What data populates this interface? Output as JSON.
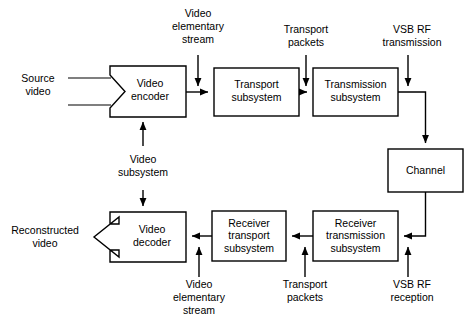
{
  "diagram": {
    "blocks": [
      {
        "id": "video-encoder",
        "label_line1": "Video",
        "label_line2": "encoder",
        "label_line3": ""
      },
      {
        "id": "transport-subsystem",
        "label_line1": "Transport",
        "label_line2": "subsystem",
        "label_line3": ""
      },
      {
        "id": "transmission-subsystem",
        "label_line1": "Transmission",
        "label_line2": "subsystem",
        "label_line3": ""
      },
      {
        "id": "channel",
        "label_line1": "Channel",
        "label_line2": "",
        "label_line3": ""
      },
      {
        "id": "receiver-transmission-subsystem",
        "label_line1": "Receiver",
        "label_line2": "transmission",
        "label_line3": "subsystem"
      },
      {
        "id": "receiver-transport-subsystem",
        "label_line1": "Receiver",
        "label_line2": "transport",
        "label_line3": "subsystem"
      },
      {
        "id": "video-decoder",
        "label_line1": "Video",
        "label_line2": "decoder",
        "label_line3": ""
      }
    ],
    "labels": [
      {
        "id": "source-video",
        "line1": "Source",
        "line2": "video",
        "line3": ""
      },
      {
        "id": "video-elementary-stream-top",
        "line1": "Video",
        "line2": "elementary",
        "line3": "stream"
      },
      {
        "id": "transport-packets-top",
        "line1": "Transport",
        "line2": "packets",
        "line3": ""
      },
      {
        "id": "vsb-rf-transmission",
        "line1": "VSB RF",
        "line2": "transmission",
        "line3": ""
      },
      {
        "id": "video-subsystem",
        "line1": "Video",
        "line2": "subsystem",
        "line3": ""
      },
      {
        "id": "reconstructed-video",
        "line1": "Reconstructed",
        "line2": "video",
        "line3": ""
      },
      {
        "id": "video-elementary-stream-bottom",
        "line1": "Video",
        "line2": "elementary",
        "line3": "stream"
      },
      {
        "id": "transport-packets-bottom",
        "line1": "Transport",
        "line2": "packets",
        "line3": ""
      },
      {
        "id": "vsb-rf-reception",
        "line1": "VSB RF",
        "line2": "reception",
        "line3": ""
      }
    ],
    "colors": {
      "stroke": "#000000",
      "fill": "#ffffff",
      "text": "#000000"
    }
  }
}
